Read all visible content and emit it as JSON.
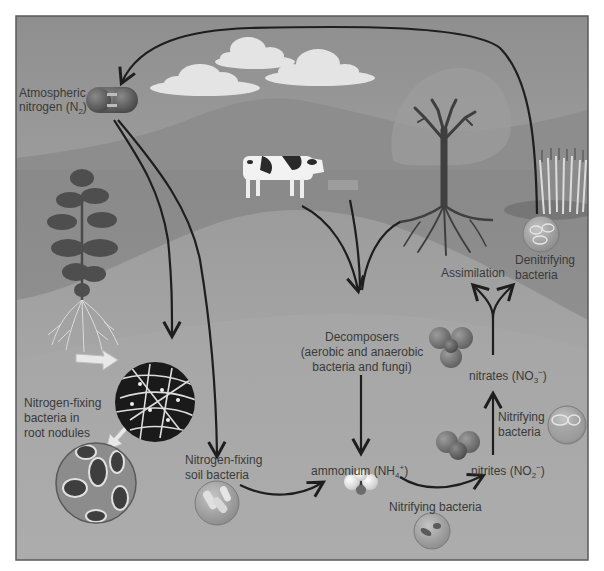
{
  "diagram": {
    "colors": {
      "page_bg": "#ffffff",
      "frame_border": "#5a5a5a",
      "sky": "#9a9a9a",
      "sky_light": "#b9b9b9",
      "hill_far": "#8e8e8e",
      "ground": "#979797",
      "soil": "#a6a6a6",
      "arrow": "#1e1e1e",
      "label_text": "#3a3a3a",
      "cloud": "#e6e6e6"
    },
    "labels": {
      "atmospheric_nitrogen": {
        "line1": "Atmospheric",
        "line2_prefix": "nitrogen (N",
        "line2_sub": "2",
        "line2_suffix": ")"
      },
      "nitrogen_fixing_root": {
        "line1": "Nitrogen-fixing",
        "line2": "bacteria in",
        "line3": "root nodules"
      },
      "nitrogen_fixing_soil": {
        "line1": "Nitrogen-fixing",
        "line2": "soil bacteria"
      },
      "decomposers": {
        "line1": "Decomposers",
        "line2": "(aerobic and anaerobic",
        "line3": "bacteria and fungi)"
      },
      "ammonium": {
        "prefix": "ammonium (NH",
        "sub": "4",
        "sup": "+",
        "suffix": ")"
      },
      "nitrifying_bottom": "Nitrifying bacteria",
      "nitrites": {
        "prefix": "nitrites (NO",
        "sub": "2",
        "sup": "−",
        "suffix": ")"
      },
      "nitrifying_right": {
        "line1": "Nitrifying",
        "line2": "bacteria"
      },
      "nitrates": {
        "prefix": "nitrates (NO",
        "sub": "3",
        "sup": "−",
        "suffix": ")"
      },
      "assimilation": "Assimilation",
      "denitrifying": {
        "line1": "Denitrifying",
        "line2": "bacteria"
      }
    },
    "nodes": [
      {
        "id": "atmospheric-nitrogen",
        "label": "Atmospheric nitrogen (N2)"
      },
      {
        "id": "nitrogen-fixing-root-nodules",
        "label": "Nitrogen-fixing bacteria in root nodules"
      },
      {
        "id": "nitrogen-fixing-soil-bacteria",
        "label": "Nitrogen-fixing soil bacteria"
      },
      {
        "id": "decomposers",
        "label": "Decomposers (aerobic and anaerobic bacteria and fungi)"
      },
      {
        "id": "ammonium",
        "label": "ammonium (NH4+)"
      },
      {
        "id": "nitrites",
        "label": "nitrites (NO2-)"
      },
      {
        "id": "nitrates",
        "label": "nitrates (NO3-)"
      },
      {
        "id": "assimilation",
        "label": "Assimilation"
      },
      {
        "id": "denitrifying-bacteria",
        "label": "Denitrifying bacteria"
      }
    ],
    "edges": [
      {
        "from": "atmospheric-nitrogen",
        "to": "nitrogen-fixing-root-nodules"
      },
      {
        "from": "atmospheric-nitrogen",
        "to": "nitrogen-fixing-soil-bacteria"
      },
      {
        "from": "nitrogen-fixing-soil-bacteria",
        "to": "ammonium"
      },
      {
        "from": "cow",
        "to": "decomposers"
      },
      {
        "from": "tree",
        "to": "decomposers"
      },
      {
        "from": "decomposers",
        "to": "ammonium"
      },
      {
        "from": "ammonium",
        "to": "nitrites",
        "label": "Nitrifying bacteria"
      },
      {
        "from": "nitrites",
        "to": "nitrates",
        "label": "Nitrifying bacteria"
      },
      {
        "from": "nitrates",
        "to": "assimilation"
      },
      {
        "from": "nitrates",
        "to": "denitrifying-bacteria"
      },
      {
        "from": "denitrifying-bacteria",
        "to": "atmospheric-nitrogen"
      }
    ],
    "illustrations": [
      "clouds",
      "hills",
      "cow",
      "tree",
      "grass",
      "plant-with-roots",
      "root-nodule-micrograph",
      "bacteria-micrograph",
      "n2-molecule",
      "ammonium-molecule",
      "nitrite-molecule",
      "nitrate-molecule"
    ]
  }
}
